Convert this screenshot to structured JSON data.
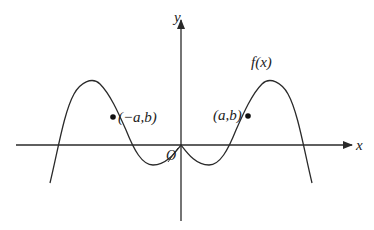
{
  "diagram": {
    "type": "function-graph",
    "function_label": "f(x)",
    "axes": {
      "x_label": "x",
      "y_label": "y",
      "origin_label": "O"
    },
    "points": [
      {
        "label": "(−a,b)",
        "name": "point-neg-a-b"
      },
      {
        "label": "(a,b)",
        "name": "point-a-b"
      }
    ],
    "colors": {
      "stroke": "#2a2a2a",
      "background": "#ffffff"
    }
  }
}
